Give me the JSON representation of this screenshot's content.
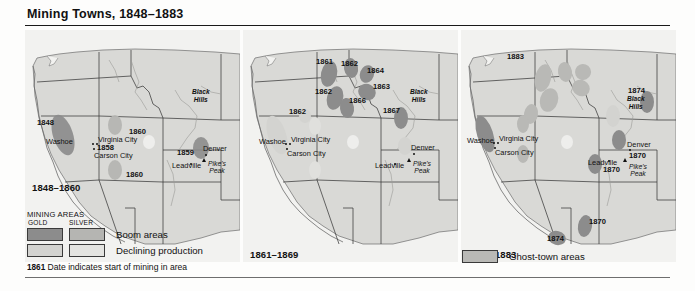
{
  "figure": {
    "title": "Mining Towns, 1848–1883"
  },
  "colors": {
    "land": "#d9d9d6",
    "border": "#6b6b6b",
    "state_line": "#1a1a1a",
    "gold_boom": "#8c8c8c",
    "silver_boom": "#b5b5b2",
    "gold_declining": "#d3d3d0",
    "silver_declining": "#e0e0dd",
    "ghost_town": "#b9b9b6",
    "river": "#9a9a97",
    "text": "#111111"
  },
  "panels": [
    {
      "id": "panel1",
      "caption": "1848–1860",
      "dates": [
        {
          "label": "1848",
          "x": 12,
          "y": 88
        },
        {
          "label": "1860",
          "x": 104,
          "y": 97
        },
        {
          "label": "1858",
          "x": 72,
          "y": 113
        },
        {
          "label": "1860",
          "x": 101,
          "y": 140
        },
        {
          "label": "1859",
          "x": 152,
          "y": 118
        }
      ],
      "cities": [
        {
          "label": "Washoe",
          "x": 21,
          "y": 107
        },
        {
          "label": "Virginia City",
          "x": 73,
          "y": 105
        },
        {
          "label": "Carson City",
          "x": 69,
          "y": 121
        },
        {
          "label": "Leadville",
          "x": 147,
          "y": 131
        },
        {
          "label": "Denver",
          "x": 178,
          "y": 114
        }
      ],
      "regions": [
        {
          "label": "Black\nHills",
          "x": 168,
          "y": 61
        }
      ],
      "peaks": [
        {
          "label": "Pike's\nPeak",
          "x": 183,
          "y": 130
        }
      ]
    },
    {
      "id": "panel2",
      "caption": "1861–1869",
      "dates": [
        {
          "label": "1861",
          "x": 73,
          "y": 27
        },
        {
          "label": "1862",
          "x": 98,
          "y": 29
        },
        {
          "label": "1864",
          "x": 124,
          "y": 36
        },
        {
          "label": "1863",
          "x": 130,
          "y": 52
        },
        {
          "label": "1862",
          "x": 72,
          "y": 57
        },
        {
          "label": "1866",
          "x": 106,
          "y": 66
        },
        {
          "label": "1867",
          "x": 140,
          "y": 76
        },
        {
          "label": "1862",
          "x": 46,
          "y": 77
        }
      ],
      "cities": [
        {
          "label": "Washoe",
          "x": 16,
          "y": 107
        },
        {
          "label": "Virginia City",
          "x": 48,
          "y": 105
        },
        {
          "label": "Carson City",
          "x": 44,
          "y": 119
        },
        {
          "label": "Leadville",
          "x": 132,
          "y": 131
        },
        {
          "label": "Denver",
          "x": 168,
          "y": 113
        }
      ],
      "regions": [
        {
          "label": "Black\nHills",
          "x": 168,
          "y": 61
        }
      ],
      "peaks": [
        {
          "label": "Pike's\nPeak",
          "x": 170,
          "y": 130
        }
      ]
    },
    {
      "id": "panel3",
      "caption": "1870–1883",
      "dates": [
        {
          "label": "1883",
          "x": 46,
          "y": 22
        },
        {
          "label": "1874",
          "x": 167,
          "y": 56
        },
        {
          "label": "1870",
          "x": 168,
          "y": 121
        },
        {
          "label": "1870",
          "x": 142,
          "y": 135
        },
        {
          "label": "1870",
          "x": 128,
          "y": 187
        },
        {
          "label": "1874",
          "x": 86,
          "y": 204
        }
      ],
      "cities": [
        {
          "label": "Washoe",
          "x": 6,
          "y": 106
        },
        {
          "label": "Virginia City",
          "x": 38,
          "y": 104
        },
        {
          "label": "Carson City",
          "x": 34,
          "y": 118
        },
        {
          "label": "Leadville",
          "x": 127,
          "y": 128
        },
        {
          "label": "Denver",
          "x": 166,
          "y": 110
        }
      ],
      "regions": [
        {
          "label": "Black\nHills",
          "x": 166,
          "y": 64
        }
      ],
      "peaks": [
        {
          "label": "Pike's\nPeak",
          "x": 168,
          "y": 130
        }
      ]
    }
  ],
  "legend": {
    "title": "MINING AREAS",
    "col_gold": "GOLD",
    "col_silver": "SILVER",
    "row_boom": "Boom areas",
    "row_declining": "Declining production",
    "note_date": "1861",
    "note_text": "Date indicates start of mining in area"
  },
  "ghost_key": {
    "label": "Ghost-town areas"
  }
}
